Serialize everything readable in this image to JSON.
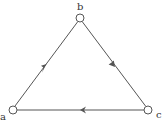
{
  "diagram": {
    "type": "directed-graph",
    "colors": {
      "stroke": "#555555",
      "node_fill": "#ffffff",
      "label": "#333333",
      "background": "#ffffff"
    },
    "nodes": [
      {
        "id": "a",
        "label": "a",
        "x": 13,
        "y": 110
      },
      {
        "id": "b",
        "label": "b",
        "x": 80,
        "y": 18
      },
      {
        "id": "c",
        "label": "c",
        "x": 148,
        "y": 110
      }
    ],
    "edges": [
      {
        "from": "a",
        "to": "b"
      },
      {
        "from": "b",
        "to": "c"
      },
      {
        "from": "c",
        "to": "a"
      }
    ]
  }
}
